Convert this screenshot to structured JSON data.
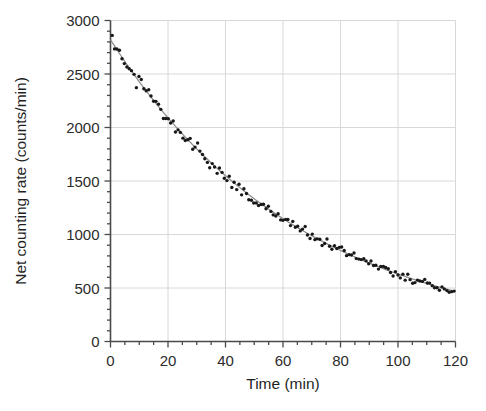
{
  "chart_data": {
    "type": "scatter",
    "title": "",
    "xlabel": "Time  (min)",
    "ylabel": "Net counting rate  (counts/min)",
    "xlim": [
      0,
      120
    ],
    "ylim": [
      0,
      3000
    ],
    "xticks": [
      0,
      20,
      40,
      60,
      80,
      100,
      120
    ],
    "xtick_labels": [
      "0",
      "20",
      "40",
      "60",
      "80",
      "100",
      "120"
    ],
    "yticks": [
      0,
      500,
      1000,
      1500,
      2000,
      2500,
      3000
    ],
    "ytick_labels": [
      "0",
      "500",
      "1000",
      "1500",
      "2000",
      "2500",
      "3000"
    ],
    "x_minor_tick_interval": 5,
    "y_minor_tick_interval": 100,
    "grid": true,
    "grid_color": "#d8d8d8",
    "axis_color": "#4a4a4a",
    "marker_color": "#181818",
    "marker_size": 1.7,
    "legend": "none",
    "fit": {
      "name": "exponential decay fit",
      "model": "A * exp(-t / tau)",
      "A": 2820,
      "tau": 66.8,
      "half_life": 46.3,
      "color": "#8c8c8c",
      "x_start": 0,
      "x_end": 120
    },
    "series": [
      {
        "name": "Net counting rate",
        "x": [
          0.6,
          1.4,
          2.2,
          3.1,
          4.0,
          4.8,
          5.7,
          6.5,
          7.3,
          8.2,
          9.0,
          9.9,
          10.7,
          11.6,
          12.4,
          13.3,
          14.1,
          15.0,
          15.8,
          16.7,
          17.5,
          18.4,
          19.2,
          20.1,
          20.9,
          21.8,
          22.6,
          23.5,
          24.3,
          25.2,
          26.0,
          26.9,
          27.7,
          28.6,
          29.4,
          30.3,
          31.1,
          32.0,
          32.8,
          33.7,
          34.5,
          35.4,
          36.2,
          37.1,
          37.9,
          38.8,
          39.6,
          40.5,
          41.3,
          42.2,
          43.0,
          43.9,
          44.7,
          45.6,
          46.4,
          47.3,
          48.1,
          49.0,
          49.8,
          50.7,
          51.5,
          52.4,
          53.2,
          54.1,
          54.9,
          55.8,
          56.6,
          57.5,
          58.3,
          59.2,
          60.0,
          60.9,
          61.7,
          62.6,
          63.4,
          64.3,
          65.1,
          66.0,
          66.8,
          67.7,
          68.5,
          69.4,
          70.2,
          71.1,
          71.9,
          72.8,
          73.6,
          74.5,
          75.3,
          76.2,
          77.0,
          77.9,
          78.7,
          79.6,
          80.4,
          81.3,
          82.1,
          83.0,
          83.8,
          84.7,
          85.5,
          86.4,
          87.2,
          88.1,
          88.9,
          89.8,
          90.6,
          91.5,
          92.3,
          93.2,
          94.0,
          94.9,
          95.7,
          96.6,
          97.4,
          98.3,
          99.1,
          100.0,
          100.8,
          101.7,
          102.5,
          103.4,
          104.2,
          105.1,
          105.9,
          106.8,
          107.6,
          108.5,
          109.3,
          110.2,
          111.0,
          111.9,
          112.7,
          113.6,
          114.4,
          115.3,
          116.1,
          117.0,
          117.8,
          118.7,
          119.5
        ],
        "y": [
          2690,
          2660,
          2680,
          2600,
          2645,
          2590,
          2600,
          2520,
          2575,
          2520,
          2545,
          2540,
          2480,
          2460,
          2415,
          2530,
          2450,
          2400,
          2370,
          2350,
          2330,
          2370,
          2290,
          2290,
          2235,
          2260,
          2230,
          2225,
          2170,
          2210,
          2190,
          2155,
          2160,
          2120,
          2100,
          2075,
          2090,
          2060,
          2035,
          2060,
          2000,
          1995,
          1975,
          1980,
          1965,
          1950,
          1900,
          1895,
          1870,
          1880,
          1860,
          1840,
          1830,
          1810,
          1800,
          1790,
          1760,
          1780,
          1740,
          1730,
          1715,
          1700,
          1690,
          1680,
          1670,
          1655,
          1640,
          1625,
          1645,
          1615,
          1595,
          1590,
          1570,
          1560,
          1550,
          1540,
          1520,
          1510,
          1500,
          1490,
          1470,
          1465,
          1455,
          1440,
          1425,
          1420,
          1400,
          1395,
          1380,
          1365,
          1350,
          1340,
          1330,
          1315,
          1300,
          1290,
          1285,
          1270,
          1255,
          1245,
          1230,
          1215,
          1210,
          1195,
          1180,
          1175,
          1160,
          1155,
          1140,
          1125,
          1110,
          1105,
          1090,
          1075,
          1065,
          1050,
          1045,
          1030,
          1015,
          1010,
          995,
          985,
          975,
          965,
          950,
          945,
          930,
          925,
          915,
          900,
          895,
          885,
          875,
          865,
          855,
          845,
          835,
          825,
          815,
          805,
          795
        ]
      }
    ],
    "scatter_jitter_note": "points include random counting noise around the fit",
    "decay_points": {
      "t0_value": 2820,
      "t120_value": 470
    }
  },
  "axis_labels": {
    "x_title": "Time  (min)",
    "y_title": "Net counting rate  (counts/min)"
  }
}
